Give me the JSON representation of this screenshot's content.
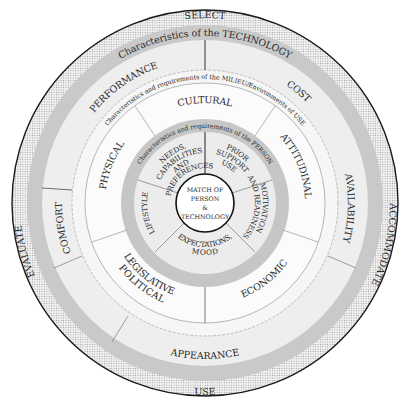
{
  "diagram": {
    "center": {
      "lines": [
        "MATCH OF",
        "PERSON",
        "&",
        "TECHNOLOGY"
      ]
    },
    "outer_ring": {
      "actions": {
        "top": "SELECT",
        "left": "EVALUATE",
        "right": "ACCOMMODATE",
        "bottom": "USE"
      }
    },
    "technology_ring": {
      "band_label": "Characteristics of the TECHNOLOGY",
      "segments": {
        "performance": "PERFORMANCE",
        "cost": "COST",
        "availability": "AVAILABILITY",
        "appearance": "APPEARANCE",
        "comfort": "COMFORT"
      }
    },
    "milieu_ring": {
      "band_label": "Characteristics and requirements of the MILIEU/Environments of USE",
      "segments": {
        "cultural": "CULTURAL",
        "attitudinal": "ATTITUDINAL",
        "economic": "ECONOMIC",
        "legislative_1": "LEGISLATIVE",
        "legislative_2": "POLITICAL",
        "physical": "PHYSICAL"
      }
    },
    "person_ring": {
      "band_label": "Characteristics and requirements of the PERSON",
      "segments": {
        "needs_1": "NEEDS,",
        "needs_2": "CAPABILITIES",
        "needs_3": "AND",
        "needs_4": "PREFERENCES",
        "prior_1": "PRIOR",
        "prior_2": "SUPPORT",
        "prior_3": "USE",
        "motivation_1": "MOTIVATION",
        "motivation_2": "AND READINESS",
        "expectations_1": "EXPECTATIONS,",
        "expectations_2": "MOOD",
        "lifestyle": "LIFESTYLE"
      }
    },
    "colors": {
      "dotted_band": "#e4e4e4",
      "gray_band": "#c9c9c9",
      "light_ring": "#efefef",
      "white_ring": "#fbfbfb",
      "outline": "#1a1a1a",
      "text": "#2a2a2a"
    }
  }
}
